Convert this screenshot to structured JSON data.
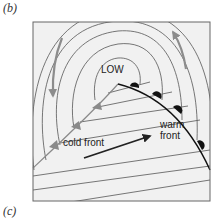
{
  "panels": {
    "top_label": "(b)",
    "bottom_label": "(c)"
  },
  "diagram": {
    "low_label": "LOW",
    "cold_front_label": "cold front",
    "warm_front_label_line1": "warm",
    "warm_front_label_line2": "front",
    "colors": {
      "box_fill": "#f1f1f1",
      "box_border": "#666666",
      "isobar": "#555555",
      "cold_front": "#8a8a8a",
      "warm_front": "#111111",
      "flow_arrow": "#8c8c8c",
      "motion_arrow": "#222222"
    },
    "icons": {
      "cold_front_symbol": "triangle",
      "warm_front_symbol": "semicircle",
      "circulation_arrow": "curved-arrow",
      "motion_arrow": "straight-arrow"
    }
  }
}
